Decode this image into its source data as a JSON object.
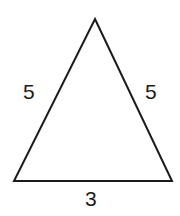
{
  "figure": {
    "shape_name": "triangle",
    "background_color": "#ffffff",
    "stroke_color": "#1b1b1b",
    "label_color": "#1b1b1b",
    "stroke_width": 2,
    "canvas": {
      "width": 180,
      "height": 216
    },
    "vertices": {
      "apex": {
        "x": 95,
        "y": 19
      },
      "bottom_left": {
        "x": 14,
        "y": 181
      },
      "bottom_right": {
        "x": 172,
        "y": 181
      }
    },
    "polygon_points": "95,19 172,181 14,181",
    "labels": {
      "left_side": "5",
      "right_side": "5",
      "base": "3"
    }
  }
}
